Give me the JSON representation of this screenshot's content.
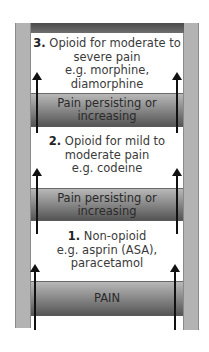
{
  "diagram": {
    "steps": [
      {
        "number": "3.",
        "text_line1": "Opioid for moderate to",
        "text_line2": "severe pain",
        "text_line3": "e.g. morphine, diamorphine"
      },
      {
        "number": "2.",
        "text_line1": "Opioid for mild to",
        "text_line2": "moderate pain",
        "text_line3": "e.g. codeine"
      },
      {
        "number": "1.",
        "text_line1": "Non-opioid",
        "text_line2": "e.g. asprin (ASA),",
        "text_line3": "paracetamol"
      }
    ],
    "bands": [
      {
        "line1": "Pain persisting or",
        "line2": "increasing"
      },
      {
        "line1": "Pain persisting or",
        "line2": "increasing"
      },
      {
        "line1": "PAIN",
        "line2": ""
      }
    ],
    "colors": {
      "rail": "#b3b3b3",
      "band_top": "#b8b8b8",
      "band_bottom": "#555555",
      "arrow": "#111111"
    }
  }
}
